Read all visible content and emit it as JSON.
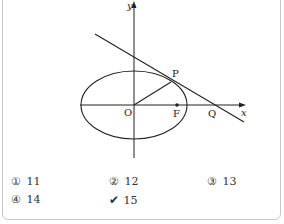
{
  "question": {
    "stem_cut_off": ""
  },
  "figure": {
    "labels": {
      "x_axis": "x",
      "y_axis": "y",
      "origin": "O",
      "focus": "F",
      "tangent_point": "P",
      "x_intercept": "Q"
    },
    "shapes": {
      "ellipse": {
        "cx": 134,
        "cy": 105,
        "rx": 53,
        "ry": 34
      },
      "tangent_line": {
        "x1": 95,
        "y1": 34,
        "x2": 244,
        "y2": 122
      },
      "segment_OP": {
        "x1": 134,
        "y1": 105,
        "x2": 171,
        "y2": 82
      },
      "focus_point": {
        "cx": 177,
        "cy": 105
      }
    },
    "line_color": "#222222"
  },
  "choices": [
    {
      "mark": "①",
      "value": "11",
      "selected": false
    },
    {
      "mark": "②",
      "value": "12",
      "selected": false
    },
    {
      "mark": "③",
      "value": "13",
      "selected": false
    },
    {
      "mark": "④",
      "value": "14",
      "selected": false
    },
    {
      "mark": "✔",
      "value": "15",
      "selected": true
    }
  ]
}
